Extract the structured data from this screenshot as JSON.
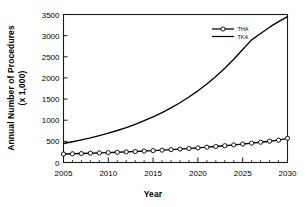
{
  "chart_data": {
    "type": "line",
    "title": "",
    "xlabel": "Year",
    "ylabel": "Annual Number of Procedures (x 1,000)",
    "ylabel_line1": "Annual Number of Procedures",
    "ylabel_line2": "(x 1,000)",
    "xlim": [
      2005,
      2030
    ],
    "ylim": [
      0,
      3500
    ],
    "xticks": [
      2005,
      2010,
      2015,
      2020,
      2025,
      2030
    ],
    "xtick_labels": [
      "2005",
      "2010",
      "2015",
      "2020",
      "2025",
      "2030"
    ],
    "yticks": [
      0,
      500,
      1000,
      1500,
      2000,
      2500,
      3000,
      3500
    ],
    "ytick_labels": [
      "0",
      "500",
      "1000",
      "1500",
      "2000",
      "2500",
      "3000",
      "3500"
    ],
    "minor_xtick_interval": 1,
    "grid": false,
    "legend_position": "top-right",
    "x": [
      2005,
      2006,
      2007,
      2008,
      2009,
      2010,
      2011,
      2012,
      2013,
      2014,
      2015,
      2016,
      2017,
      2018,
      2019,
      2020,
      2021,
      2022,
      2023,
      2024,
      2025,
      2026,
      2027,
      2028,
      2029,
      2030
    ],
    "series": [
      {
        "name": "THA",
        "marker": "open-circle",
        "line_style": "solid",
        "color": "#000000",
        "values": [
          200,
          206,
          212,
          219,
          226,
          234,
          242,
          251,
          260,
          270,
          281,
          292,
          304,
          317,
          331,
          346,
          362,
          379,
          397,
          416,
          436,
          457,
          479,
          503,
          528,
          572
        ]
      },
      {
        "name": "TKA",
        "marker": "none",
        "line_style": "solid",
        "color": "#000000",
        "values": [
          450,
          490,
          534,
          582,
          635,
          693,
          757,
          827,
          904,
          988,
          1080,
          1181,
          1292,
          1414,
          1548,
          1695,
          1857,
          2034,
          2228,
          2441,
          2674,
          2900,
          3050,
          3200,
          3330,
          3450
        ]
      }
    ]
  },
  "legend": {
    "entries": [
      {
        "label": "THA"
      },
      {
        "label": "TKA"
      }
    ]
  }
}
